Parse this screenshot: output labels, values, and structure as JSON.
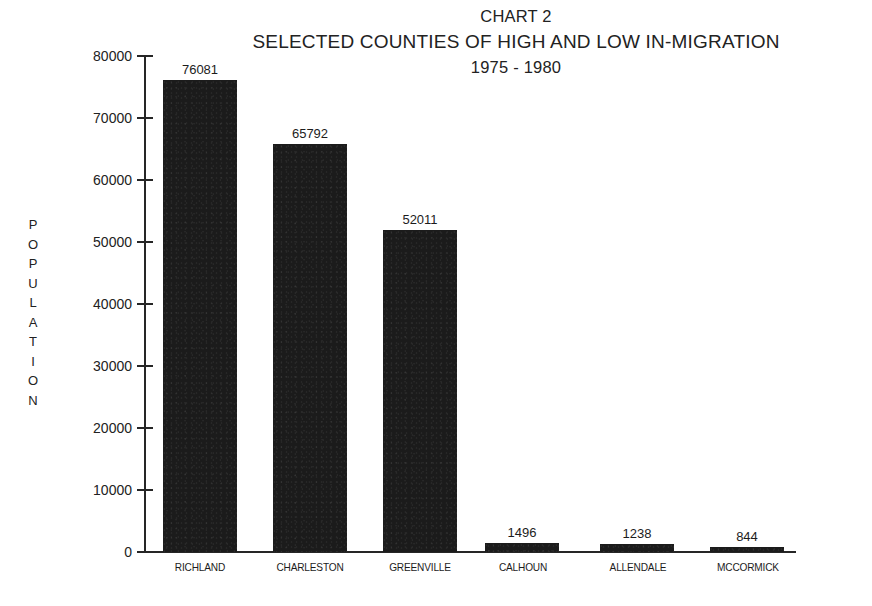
{
  "chart_data": {
    "type": "bar",
    "title": "CHART 2",
    "subtitle": "SELECTED COUNTIES OF HIGH AND LOW IN-MIGRATION",
    "subtitle2": "1975 - 1980",
    "xlabel": "",
    "ylabel": "POPULATION",
    "ylim": [
      0,
      80000
    ],
    "ytick_step": 10000,
    "ytick_labels": [
      "80000",
      "70000",
      "60000",
      "50000",
      "40000",
      "30000",
      "20000",
      "10000",
      "0"
    ],
    "ytick_values": [
      80000,
      70000,
      60000,
      50000,
      40000,
      30000,
      20000,
      10000,
      0
    ],
    "grid": false,
    "legend": false,
    "bar_color": "#1b1b1b",
    "categories": [
      "RICHLAND",
      "CHARLESTON",
      "GREENVILLE",
      "CALHOUN",
      "ALLENDALE",
      "MCCORMICK"
    ],
    "values": [
      76081,
      65792,
      52011,
      1496,
      1238,
      844
    ],
    "value_labels": [
      "76081",
      "65792",
      "52011",
      "1496",
      "1238",
      "844"
    ]
  },
  "axis_title_letters": [
    "P",
    "O",
    "P",
    "U",
    "L",
    "A",
    "T",
    "I",
    "O",
    "N"
  ]
}
